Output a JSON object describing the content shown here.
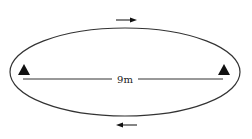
{
  "diagram": {
    "distance_label": "9m",
    "colors": {
      "stroke": "#333333",
      "fill": "#111111",
      "background": "#ffffff"
    },
    "elements": {
      "track": "oval-track",
      "cones": [
        "left-cone",
        "right-cone"
      ],
      "arrows": [
        {
          "position": "top",
          "direction": "right"
        },
        {
          "position": "bottom",
          "direction": "left"
        }
      ]
    }
  }
}
